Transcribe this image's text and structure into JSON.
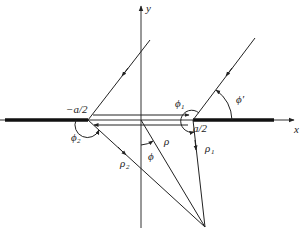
{
  "diagram": {
    "type": "geometry-diffraction-slit",
    "axes": {
      "x_label": "x",
      "y_label": "y"
    },
    "points": {
      "left_edge_label": "−a/2",
      "right_edge_label": "a/2"
    },
    "angles": {
      "phi": "ϕ",
      "phi1": "ϕ",
      "phi1_sub": "1",
      "phi2": "ϕ",
      "phi2_sub": "2",
      "phi_prime": "ϕ′"
    },
    "distances": {
      "rho": "ρ",
      "rho1": "ρ",
      "rho1_sub": "1",
      "rho2": "ρ",
      "rho2_sub": "2"
    },
    "colors": {
      "line": "#222222",
      "background": "#ffffff"
    }
  }
}
